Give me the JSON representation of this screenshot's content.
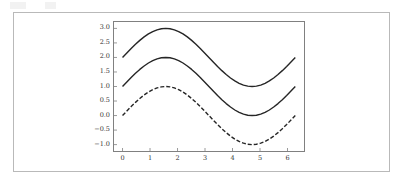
{
  "figure": {
    "background_color": "#ffffff",
    "outer_border_color": "#b9b9b9",
    "frame_color": "#808080",
    "line_color": "#262626"
  },
  "chart_data": {
    "type": "line",
    "title": "",
    "subtitle": "",
    "xlabel": "",
    "ylabel": "",
    "xlim": [
      -0.31,
      6.6
    ],
    "ylim": [
      -1.22,
      3.22
    ],
    "grid": false,
    "legend": null,
    "legend_position": "none",
    "xticks": [
      0,
      1,
      2,
      3,
      4,
      5,
      6
    ],
    "xtick_labels": [
      "0",
      "1",
      "2",
      "3",
      "4",
      "5",
      "6"
    ],
    "yticks": [
      -1.0,
      -0.5,
      0.0,
      0.5,
      1.0,
      1.5,
      2.0,
      2.5,
      3.0
    ],
    "ytick_labels": [
      "-1.0",
      "-0.5",
      "0.0",
      "0.5",
      "1.0",
      "1.5",
      "2.0",
      "2.5",
      "3.0"
    ],
    "x": [
      0.0,
      0.1571,
      0.3142,
      0.4712,
      0.6283,
      0.7854,
      0.9425,
      1.0996,
      1.2566,
      1.4137,
      1.5708,
      1.7279,
      1.885,
      2.042,
      2.1991,
      2.3562,
      2.5133,
      2.6704,
      2.8274,
      2.9845,
      3.1416,
      3.2987,
      3.4558,
      3.6128,
      3.7699,
      3.927,
      4.0841,
      4.2412,
      4.3982,
      4.5553,
      4.7124,
      4.8695,
      5.0265,
      5.1836,
      5.3407,
      5.4978,
      5.6549,
      5.8119,
      5.969,
      6.1261,
      6.2832
    ],
    "series": [
      {
        "name": "sin(x) + 2",
        "formula": "y = sin(x) + 2",
        "style": "solid",
        "color": "#262626",
        "linewidth": 1.4,
        "values": [
          2.0,
          2.1564,
          2.309,
          2.454,
          2.5878,
          2.7071,
          2.809,
          2.891,
          2.9511,
          2.9877,
          3.0,
          2.9877,
          2.9511,
          2.891,
          2.809,
          2.7071,
          2.5878,
          2.454,
          2.309,
          2.1564,
          2.0,
          1.8436,
          1.691,
          1.546,
          1.4122,
          1.2929,
          1.191,
          1.109,
          1.0489,
          1.0123,
          1.0,
          1.0123,
          1.0489,
          1.109,
          1.191,
          1.2929,
          1.4122,
          1.546,
          1.691,
          1.8436,
          2.0
        ]
      },
      {
        "name": "sin(x) + 1",
        "formula": "y = sin(x) + 1",
        "style": "solid",
        "color": "#262626",
        "linewidth": 1.4,
        "values": [
          1.0,
          1.1564,
          1.309,
          1.454,
          1.5878,
          1.7071,
          1.809,
          1.891,
          1.9511,
          1.9877,
          2.0,
          1.9877,
          1.9511,
          1.891,
          1.809,
          1.7071,
          1.5878,
          1.454,
          1.309,
          1.1564,
          1.0,
          0.8436,
          0.691,
          0.546,
          0.4122,
          0.2929,
          0.191,
          0.109,
          0.0489,
          0.0123,
          0.0,
          0.0123,
          0.0489,
          0.109,
          0.191,
          0.2929,
          0.4122,
          0.546,
          0.691,
          0.8436,
          1.0
        ]
      },
      {
        "name": "sin(x)",
        "formula": "y = sin(x)",
        "style": "dashed",
        "color": "#262626",
        "linewidth": 1.4,
        "dash_pattern": "4 2",
        "values": [
          0.0,
          0.1564,
          0.309,
          0.454,
          0.5878,
          0.7071,
          0.809,
          0.891,
          0.9511,
          0.9877,
          1.0,
          0.9877,
          0.9511,
          0.891,
          0.809,
          0.7071,
          0.5878,
          0.454,
          0.309,
          0.1564,
          0.0,
          -0.1564,
          -0.309,
          -0.454,
          -0.5878,
          -0.7071,
          -0.809,
          -0.891,
          -0.9511,
          -0.9877,
          -1.0,
          -0.9877,
          -0.9511,
          -0.891,
          -0.809,
          -0.7071,
          -0.5878,
          -0.454,
          -0.309,
          -0.1564,
          0.0
        ]
      }
    ]
  }
}
